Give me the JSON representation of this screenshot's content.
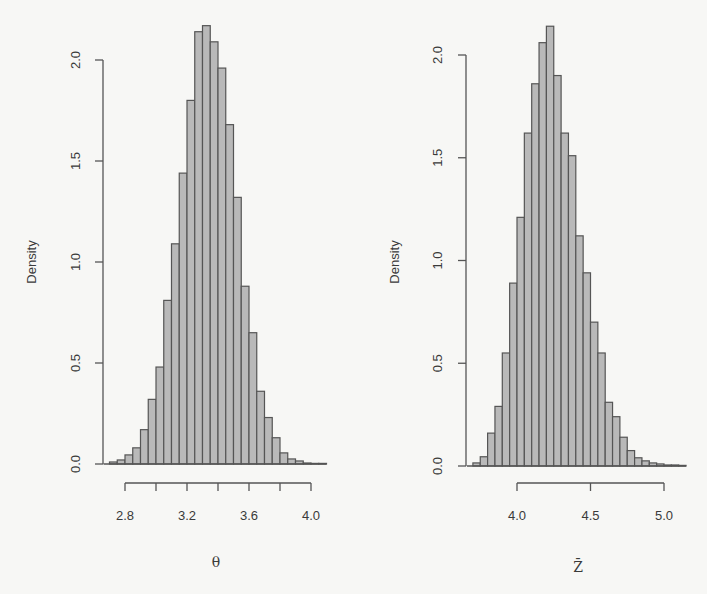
{
  "figure": {
    "background": "#f7f7f5",
    "bar_fill": "#b9b9b9",
    "bar_stroke": "#555555"
  },
  "chart_data": [
    {
      "type": "bar",
      "subtype": "histogram",
      "title": "",
      "xlabel": "θ",
      "ylabel": "Density",
      "bin_width": 0.05,
      "bin_starts": [
        2.7,
        2.75,
        2.8,
        2.85,
        2.9,
        2.95,
        3.0,
        3.05,
        3.1,
        3.15,
        3.2,
        3.25,
        3.3,
        3.35,
        3.4,
        3.45,
        3.5,
        3.55,
        3.6,
        3.65,
        3.7,
        3.75,
        3.8,
        3.85,
        3.9,
        3.95,
        4.0,
        4.05
      ],
      "values": [
        0.01,
        0.02,
        0.045,
        0.08,
        0.17,
        0.32,
        0.48,
        0.81,
        1.09,
        1.44,
        1.8,
        2.14,
        2.17,
        2.09,
        1.96,
        1.68,
        1.32,
        0.88,
        0.65,
        0.36,
        0.23,
        0.13,
        0.055,
        0.025,
        0.015,
        0.005,
        0.003,
        0.003
      ],
      "xticks": [
        2.8,
        3.0,
        3.2,
        3.4,
        3.6,
        3.8,
        4.0
      ],
      "xtick_labels": [
        "2.8",
        "",
        "3.2",
        "",
        "3.6",
        "",
        "4.0"
      ],
      "yticks": [
        0.0,
        0.5,
        1.0,
        1.5,
        2.0
      ],
      "ytick_labels": [
        "0.0",
        "0.5",
        "1.0",
        "1.5",
        "2.0"
      ],
      "xlim": [
        2.7,
        4.1
      ],
      "ylim": [
        0,
        2.2
      ],
      "grid": false,
      "legend": null
    },
    {
      "type": "bar",
      "subtype": "histogram",
      "title": "",
      "xlabel": "Z̄",
      "ylabel": "Density",
      "bin_width": 0.05,
      "bin_starts": [
        3.7,
        3.75,
        3.8,
        3.85,
        3.9,
        3.95,
        4.0,
        4.05,
        4.1,
        4.15,
        4.2,
        4.25,
        4.3,
        4.35,
        4.4,
        4.45,
        4.5,
        4.55,
        4.6,
        4.65,
        4.7,
        4.75,
        4.8,
        4.85,
        4.9,
        4.95,
        5.0,
        5.05,
        5.1
      ],
      "values": [
        0.015,
        0.045,
        0.16,
        0.29,
        0.55,
        0.89,
        1.21,
        1.62,
        1.86,
        2.06,
        2.14,
        1.9,
        1.62,
        1.51,
        1.12,
        0.94,
        0.7,
        0.55,
        0.31,
        0.24,
        0.14,
        0.075,
        0.04,
        0.025,
        0.015,
        0.01,
        0.005,
        0.005,
        0.003
      ],
      "xticks": [
        4.0,
        4.5,
        5.0
      ],
      "xtick_labels": [
        "4.0",
        "4.5",
        "5.0"
      ],
      "yticks": [
        0.0,
        0.5,
        1.0,
        1.5,
        2.0
      ],
      "ytick_labels": [
        "0.0",
        "0.5",
        "1.0",
        "1.5",
        "2.0"
      ],
      "xlim": [
        3.7,
        5.15
      ],
      "ylim": [
        0,
        2.2
      ],
      "grid": false,
      "legend": null
    }
  ],
  "layout": {
    "panels": [
      {
        "y_axis_x": 103,
        "y0_px": 464,
        "y_px_per_unit": 202,
        "x_ref_value": 2.8,
        "x_ref_px": 125,
        "x_px_per_unit": 155,
        "x_axis_y": 483,
        "x_tick_len": 8,
        "ylabel_x": 36,
        "ylabel_y": 262,
        "ytick_label_x": 80,
        "xtick_label_y": 520,
        "xlabel_x": 216,
        "xlabel_y": 567,
        "baseline_extend_left": 6
      },
      {
        "y_axis_x": 466,
        "y0_px": 466,
        "y_px_per_unit": 205.5,
        "x_ref_value": 4.0,
        "x_ref_px": 517,
        "x_px_per_unit": 147,
        "x_axis_y": 483,
        "x_tick_len": 8,
        "ylabel_x": 399,
        "ylabel_y": 262,
        "ytick_label_x": 442,
        "xtick_label_y": 520,
        "xlabel_x": 578,
        "xlabel_y": 572,
        "baseline_extend_left": 6
      }
    ]
  }
}
